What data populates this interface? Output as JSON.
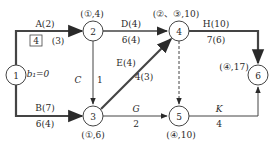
{
  "nodes": [
    {
      "id": "1",
      "x": 16,
      "y": 75
    },
    {
      "id": "2",
      "x": 93,
      "y": 31
    },
    {
      "id": "3",
      "x": 93,
      "y": 116
    },
    {
      "id": "4",
      "x": 179,
      "y": 31
    },
    {
      "id": "5",
      "x": 179,
      "y": 116
    },
    {
      "id": "6",
      "x": 258,
      "y": 75
    }
  ],
  "node_labels": {
    "n2": "(①,4)",
    "n3": "(①,6)",
    "n4": "(②、③,10)",
    "n5": "(④,10)",
    "n6": "(④,17)"
  },
  "arrows": {
    "A": {
      "top": "A(2)",
      "bottom": "(3)",
      "boxed": "4"
    },
    "B": {
      "top": "B(7)",
      "bottom": "6(4)"
    },
    "C": {
      "name": "C",
      "value": "1"
    },
    "D": {
      "top": "D(4)",
      "bottom": "6(4)"
    },
    "E": {
      "top": "E(4)",
      "bottom": "4(3)"
    },
    "G": {
      "top": "G",
      "bottom": "2"
    },
    "H": {
      "top": "H(10)",
      "bottom": "7(6)"
    },
    "K": {
      "top": "K",
      "bottom": "4"
    }
  },
  "b1_label": "b₁=0"
}
